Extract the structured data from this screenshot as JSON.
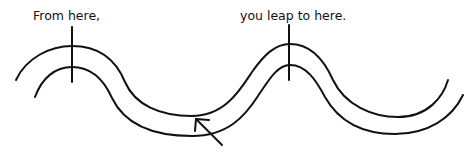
{
  "diagram": {
    "labels": {
      "from": "From here,",
      "to": "you leap to here."
    },
    "elements": [
      "double-wavy-path",
      "start-tick-mark",
      "end-tick-mark",
      "arrow-pointing-at-path"
    ],
    "colors": {
      "stroke": "#111111",
      "background": "#ffffff"
    }
  }
}
